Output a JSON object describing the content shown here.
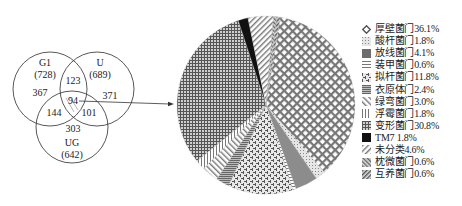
{
  "venn": {
    "sets": [
      {
        "name": "G1",
        "total": "(728)"
      },
      {
        "name": "U",
        "total": "(689)"
      },
      {
        "name": "UG",
        "total": "(642)"
      }
    ],
    "regions": {
      "g1_only": "367",
      "u_only": "371",
      "ug_only": "303",
      "g1_u": "123",
      "g1_ug": "144",
      "u_ug": "101",
      "all": "94"
    }
  },
  "chart_data": {
    "type": "pie",
    "title": "",
    "categories": [
      "厚壁菌门",
      "酸杆菌门",
      "放线菌门",
      "装甲菌门",
      "拟杆菌门",
      "衣原体门",
      "绿弯菌门",
      "浮霉菌门",
      "变形菌门",
      "TM7",
      "未分类",
      "枕微菌门",
      "互养菌门"
    ],
    "values": [
      36.1,
      1.8,
      4.1,
      0.6,
      11.8,
      2.4,
      3.0,
      1.8,
      30.8,
      1.8,
      4.6,
      0.6,
      0.6
    ],
    "unit": "%",
    "legend_position": "right",
    "legend": [
      {
        "label": "厚壁菌门36.1%",
        "pattern": "diamond-lattice"
      },
      {
        "label": "酸杆菌门1.8%",
        "pattern": "fine-dots"
      },
      {
        "label": "放线菌门4.1%",
        "pattern": "solid-gray"
      },
      {
        "label": "装甲菌门0.6%",
        "pattern": "horizontal-lines"
      },
      {
        "label": "拟杆菌门11.8%",
        "pattern": "weave"
      },
      {
        "label": "衣原体门2.4%",
        "pattern": "dense-horizontal"
      },
      {
        "label": "绿弯菌门3.0%",
        "pattern": "diagonal-back"
      },
      {
        "label": "浮霉菌门1.8%",
        "pattern": "vertical-lines"
      },
      {
        "label": "变形菌门30.8%",
        "pattern": "grid"
      },
      {
        "label": "TM7 1.8%",
        "pattern": "solid-black"
      },
      {
        "label": "未分类4.6%",
        "pattern": "diagonal-forward"
      },
      {
        "label": "枕微菌门0.6%",
        "pattern": "diagonal-back-dense"
      },
      {
        "label": "互养菌门0.6%",
        "pattern": "diagonal-forward-dense"
      }
    ]
  },
  "annotation": {
    "arrow": "venn-intersection-to-pie"
  }
}
